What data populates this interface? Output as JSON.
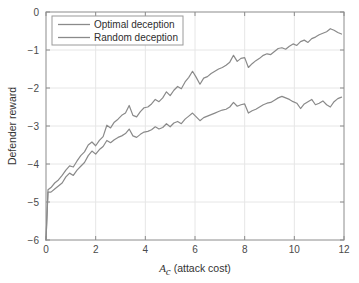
{
  "chart_data": {
    "type": "line",
    "title": "",
    "xlabel": "A_c (attack cost)",
    "xlabel_symbol": "A",
    "xlabel_subscript": "c",
    "xlabel_rest": " (attack cost)",
    "ylabel": "Defender reward",
    "xlim": [
      0,
      12
    ],
    "ylim": [
      -6,
      0
    ],
    "xticks": [
      0,
      2,
      4,
      6,
      8,
      10,
      12
    ],
    "xticklabels": [
      "0",
      "2",
      "4",
      "6",
      "8",
      "10",
      "12"
    ],
    "yticks": [
      0,
      -1,
      -2,
      -3,
      -4,
      -5,
      -6
    ],
    "yticklabels": [
      "0",
      "-1",
      "-2",
      "-3",
      "-4",
      "-5",
      "-6"
    ],
    "grid": true,
    "legend_position": "upper-left",
    "line_color": "#8a8a8a",
    "axis_color": "#8c8c8c",
    "grid_color": "#e6e6e6",
    "background": "#ffffff",
    "series": [
      {
        "name": "Optimal deception",
        "color": "#8a8a8a",
        "x": [
          0.0,
          0.08,
          0.2,
          0.35,
          0.5,
          0.65,
          0.8,
          0.95,
          1.1,
          1.25,
          1.4,
          1.55,
          1.7,
          1.85,
          2.0,
          2.15,
          2.3,
          2.45,
          2.6,
          2.75,
          2.9,
          3.05,
          3.2,
          3.35,
          3.5,
          3.65,
          3.8,
          3.95,
          4.1,
          4.25,
          4.4,
          4.55,
          4.7,
          4.85,
          5.0,
          5.15,
          5.3,
          5.45,
          5.6,
          5.75,
          5.9,
          6.05,
          6.2,
          6.35,
          6.5,
          6.65,
          6.8,
          6.95,
          7.1,
          7.25,
          7.4,
          7.55,
          7.7,
          7.85,
          8.0,
          8.15,
          8.3,
          8.45,
          8.6,
          8.75,
          8.9,
          9.05,
          9.2,
          9.35,
          9.5,
          9.65,
          9.8,
          9.95,
          10.1,
          10.25,
          10.4,
          10.55,
          10.7,
          10.85,
          11.0,
          11.15,
          11.3,
          11.45,
          11.6,
          11.75,
          11.9
        ],
        "y": [
          -6.0,
          -4.68,
          -4.62,
          -4.5,
          -4.42,
          -4.3,
          -4.16,
          -4.05,
          -4.08,
          -3.92,
          -3.78,
          -3.68,
          -3.5,
          -3.42,
          -3.52,
          -3.38,
          -3.28,
          -2.98,
          -3.05,
          -2.9,
          -2.82,
          -2.72,
          -2.66,
          -2.46,
          -2.72,
          -2.76,
          -2.62,
          -2.52,
          -2.5,
          -2.42,
          -2.3,
          -2.36,
          -2.26,
          -2.1,
          -2.2,
          -2.06,
          -1.96,
          -2.02,
          -1.84,
          -1.72,
          -1.56,
          -1.72,
          -1.9,
          -1.74,
          -1.7,
          -1.62,
          -1.56,
          -1.5,
          -1.46,
          -1.4,
          -1.32,
          -1.14,
          -1.3,
          -1.22,
          -1.2,
          -1.46,
          -1.36,
          -1.28,
          -1.22,
          -1.14,
          -1.1,
          -1.12,
          -1.04,
          -0.96,
          -0.94,
          -0.98,
          -0.9,
          -0.84,
          -0.88,
          -0.78,
          -0.74,
          -0.8,
          -0.7,
          -0.66,
          -0.6,
          -0.56,
          -0.52,
          -0.44,
          -0.48,
          -0.54,
          -0.58
        ]
      },
      {
        "name": "Random deception",
        "color": "#8a8a8a",
        "x": [
          0.0,
          0.08,
          0.2,
          0.35,
          0.5,
          0.65,
          0.8,
          0.95,
          1.1,
          1.25,
          1.4,
          1.55,
          1.7,
          1.85,
          2.0,
          2.15,
          2.3,
          2.45,
          2.6,
          2.75,
          2.9,
          3.05,
          3.2,
          3.35,
          3.5,
          3.65,
          3.8,
          3.95,
          4.1,
          4.25,
          4.4,
          4.55,
          4.7,
          4.85,
          5.0,
          5.15,
          5.3,
          5.45,
          5.6,
          5.75,
          5.9,
          6.05,
          6.2,
          6.35,
          6.5,
          6.65,
          6.8,
          6.95,
          7.1,
          7.25,
          7.4,
          7.55,
          7.7,
          7.85,
          8.0,
          8.15,
          8.3,
          8.45,
          8.6,
          8.75,
          8.9,
          9.05,
          9.2,
          9.35,
          9.5,
          9.65,
          9.8,
          9.95,
          10.1,
          10.25,
          10.4,
          10.55,
          10.7,
          10.85,
          11.0,
          11.15,
          11.3,
          11.45,
          11.6,
          11.75,
          11.9
        ],
        "y": [
          -6.0,
          -4.74,
          -4.74,
          -4.66,
          -4.58,
          -4.5,
          -4.34,
          -4.24,
          -4.3,
          -4.16,
          -4.06,
          -3.96,
          -3.78,
          -3.66,
          -3.74,
          -3.62,
          -3.54,
          -3.38,
          -3.44,
          -3.36,
          -3.3,
          -3.26,
          -3.2,
          -3.08,
          -3.26,
          -3.3,
          -3.22,
          -3.16,
          -3.14,
          -3.1,
          -3.02,
          -3.08,
          -3.04,
          -2.94,
          -3.02,
          -2.92,
          -2.88,
          -2.94,
          -2.82,
          -2.74,
          -2.66,
          -2.76,
          -2.86,
          -2.78,
          -2.74,
          -2.7,
          -2.66,
          -2.62,
          -2.58,
          -2.56,
          -2.5,
          -2.38,
          -2.48,
          -2.44,
          -2.42,
          -2.66,
          -2.6,
          -2.56,
          -2.5,
          -2.44,
          -2.4,
          -2.38,
          -2.32,
          -2.26,
          -2.22,
          -2.26,
          -2.3,
          -2.36,
          -2.4,
          -2.54,
          -2.42,
          -2.36,
          -2.3,
          -2.44,
          -2.4,
          -2.34,
          -2.44,
          -2.5,
          -2.36,
          -2.28,
          -2.24
        ]
      }
    ]
  },
  "legend": {
    "items": [
      {
        "label": "Optimal deception"
      },
      {
        "label": "Random deception"
      }
    ]
  }
}
